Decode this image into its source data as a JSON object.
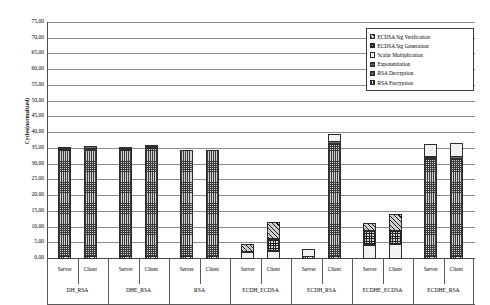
{
  "chart_data": {
    "type": "bar",
    "subtype": "stacked-grouped",
    "title": "",
    "xlabel": "",
    "ylabel": "Cycles(normalized)",
    "ylim": [
      0,
      75
    ],
    "ytick_step": 5,
    "ytick_labels": [
      "75,00",
      "70,00",
      "65,00",
      "60,00",
      "55,00",
      "50,00",
      "45,00",
      "40,00",
      "35,00",
      "30,00",
      "25,00",
      "20,00",
      "15,00",
      "10,00",
      "5,00",
      "0,00"
    ],
    "grid": true,
    "legend_position": "top-right",
    "groups": [
      "DH_RSA",
      "DHE_RSA",
      "RSA",
      "ECDH_ECDSA",
      "ECDH_RSA",
      "ECDHE_ECDSA",
      "ECDHE_RSA"
    ],
    "subcategories": [
      "Server",
      "Client"
    ],
    "series": [
      {
        "name": "ECDSA Sig Verification",
        "pattern": "p-ecdsa-ver",
        "color": "#cfcfcf",
        "values": [
          0,
          0,
          0,
          0,
          0,
          0,
          2.6,
          5.5,
          0,
          0,
          2.8,
          5.6,
          0,
          0
        ]
      },
      {
        "name": "ECDSA Sig Generation",
        "pattern": "p-ecdsa-gen",
        "color": "#d8d8d8",
        "values": [
          0,
          0,
          0,
          0,
          0,
          0,
          0,
          4.3,
          0,
          0,
          4.6,
          4.6,
          0,
          0
        ]
      },
      {
        "name": "Scalar Multiplication",
        "pattern": "p-scalar",
        "color": "#f2f2f2",
        "values": [
          0,
          0,
          0,
          0,
          0,
          0,
          2.2,
          2.3,
          2.3,
          2.4,
          4.5,
          4.6,
          4.3,
          4.4
        ]
      },
      {
        "name": "Exponentiation",
        "pattern": "p-expo",
        "color": "#6f6f6f",
        "values": [
          1.0,
          1.2,
          1.0,
          1.2,
          0,
          0,
          0,
          0,
          0,
          1.1,
          0,
          0,
          1.0,
          1.1
        ]
      },
      {
        "name": "RSA Decryption",
        "pattern": "p-rsa-dec",
        "color": "#d2d2d2",
        "values": [
          34.0,
          34.2,
          34.0,
          34.6,
          34.0,
          34.0,
          0,
          0,
          0,
          35.8,
          0,
          0,
          31.0,
          31.0
        ]
      },
      {
        "name": "RSA Encryption",
        "pattern": "p-rsa-enc",
        "color": "#e6e6e6",
        "values": [
          0.9,
          0.9,
          0.9,
          0.9,
          0.9,
          0.9,
          0,
          0,
          0.9,
          0.9,
          0,
          0,
          0.9,
          0.9
        ]
      }
    ],
    "totals": [
      35.9,
      36.3,
      35.9,
      36.7,
      34.9,
      34.9,
      4.8,
      12.1,
      3.2,
      40.2,
      11.9,
      14.8,
      37.2,
      37.4
    ]
  },
  "legend": {
    "items": [
      {
        "label": "ECDSA Sig Verification"
      },
      {
        "label": "ECDSA Sig Generation"
      },
      {
        "label": "Scalar Multiplication"
      },
      {
        "label": "Exponentiation"
      },
      {
        "label": "RSA Decryption"
      },
      {
        "label": "RSA Encryption"
      }
    ]
  }
}
